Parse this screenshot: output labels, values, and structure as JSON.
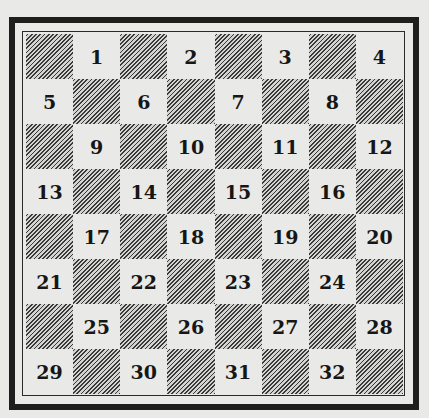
{
  "diagram": {
    "type": "numbered-checkerboard",
    "rows": 8,
    "cols": 8,
    "colors": {
      "paper": "#e9e9e7",
      "ink": "#161616",
      "frame": "#1e1e1e",
      "hatch": "#3a3a3a"
    },
    "dark_square_fill": "diagonal-hatching",
    "board": [
      [
        {
          "dark": true,
          "n": ""
        },
        {
          "dark": false,
          "n": "1"
        },
        {
          "dark": true,
          "n": ""
        },
        {
          "dark": false,
          "n": "2"
        },
        {
          "dark": true,
          "n": ""
        },
        {
          "dark": false,
          "n": "3"
        },
        {
          "dark": true,
          "n": ""
        },
        {
          "dark": false,
          "n": "4"
        }
      ],
      [
        {
          "dark": false,
          "n": "5"
        },
        {
          "dark": true,
          "n": ""
        },
        {
          "dark": false,
          "n": "6"
        },
        {
          "dark": true,
          "n": ""
        },
        {
          "dark": false,
          "n": "7"
        },
        {
          "dark": true,
          "n": ""
        },
        {
          "dark": false,
          "n": "8"
        },
        {
          "dark": true,
          "n": ""
        }
      ],
      [
        {
          "dark": true,
          "n": ""
        },
        {
          "dark": false,
          "n": "9"
        },
        {
          "dark": true,
          "n": ""
        },
        {
          "dark": false,
          "n": "10"
        },
        {
          "dark": true,
          "n": ""
        },
        {
          "dark": false,
          "n": "11"
        },
        {
          "dark": true,
          "n": ""
        },
        {
          "dark": false,
          "n": "12"
        }
      ],
      [
        {
          "dark": false,
          "n": "13"
        },
        {
          "dark": true,
          "n": ""
        },
        {
          "dark": false,
          "n": "14"
        },
        {
          "dark": true,
          "n": ""
        },
        {
          "dark": false,
          "n": "15"
        },
        {
          "dark": true,
          "n": ""
        },
        {
          "dark": false,
          "n": "16"
        },
        {
          "dark": true,
          "n": ""
        }
      ],
      [
        {
          "dark": true,
          "n": ""
        },
        {
          "dark": false,
          "n": "17"
        },
        {
          "dark": true,
          "n": ""
        },
        {
          "dark": false,
          "n": "18"
        },
        {
          "dark": true,
          "n": ""
        },
        {
          "dark": false,
          "n": "19"
        },
        {
          "dark": true,
          "n": ""
        },
        {
          "dark": false,
          "n": "20"
        }
      ],
      [
        {
          "dark": false,
          "n": "21"
        },
        {
          "dark": true,
          "n": ""
        },
        {
          "dark": false,
          "n": "22"
        },
        {
          "dark": true,
          "n": ""
        },
        {
          "dark": false,
          "n": "23"
        },
        {
          "dark": true,
          "n": ""
        },
        {
          "dark": false,
          "n": "24"
        },
        {
          "dark": true,
          "n": ""
        }
      ],
      [
        {
          "dark": true,
          "n": ""
        },
        {
          "dark": false,
          "n": "25"
        },
        {
          "dark": true,
          "n": ""
        },
        {
          "dark": false,
          "n": "26"
        },
        {
          "dark": true,
          "n": ""
        },
        {
          "dark": false,
          "n": "27"
        },
        {
          "dark": true,
          "n": ""
        },
        {
          "dark": false,
          "n": "28"
        }
      ],
      [
        {
          "dark": false,
          "n": "29"
        },
        {
          "dark": true,
          "n": ""
        },
        {
          "dark": false,
          "n": "30"
        },
        {
          "dark": true,
          "n": ""
        },
        {
          "dark": false,
          "n": "31"
        },
        {
          "dark": true,
          "n": ""
        },
        {
          "dark": false,
          "n": "32"
        },
        {
          "dark": true,
          "n": ""
        }
      ]
    ]
  }
}
